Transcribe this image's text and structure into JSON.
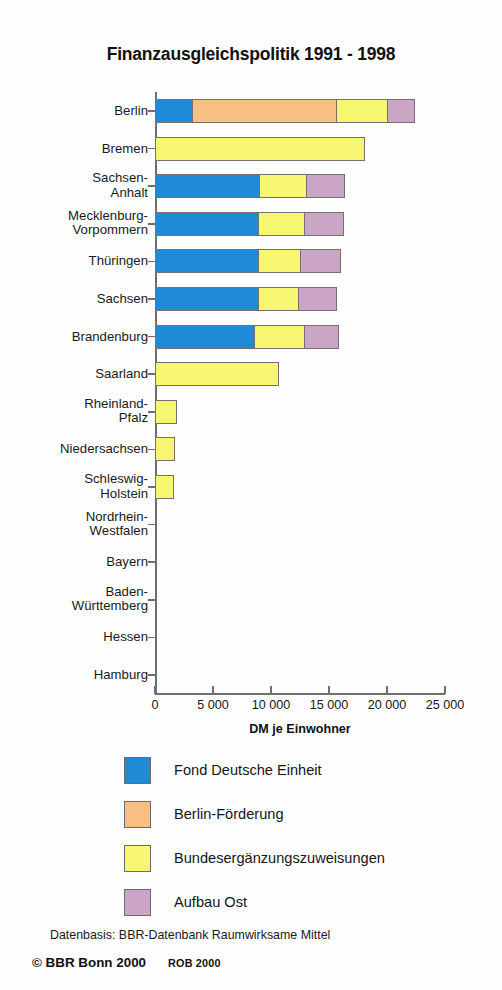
{
  "chart_data": {
    "type": "bar",
    "orientation": "horizontal",
    "stacked": true,
    "title": "Finanzausgleichspolitik 1991 - 1998",
    "xlabel": "DM je Einwohner",
    "ylabel": "",
    "xlim": [
      0,
      25000
    ],
    "xticks": [
      0,
      5000,
      10000,
      15000,
      20000,
      25000
    ],
    "xticklabels": [
      "0",
      "5 000",
      "10 000",
      "15 000",
      "20 000",
      "25 000"
    ],
    "grid": false,
    "legend_position": "below",
    "categories": [
      "Berlin",
      "Bremen",
      "Sachsen-\nAnhalt",
      "Mecklenburg-\nVorpommern",
      "Thüringen",
      "Sachsen",
      "Brandenburg",
      "Saarland",
      "Rheinland-\nPfalz",
      "Niedersachsen",
      "Schleswig-\nHolstein",
      "Nordrhein-\nWestfalen",
      "Bayern",
      "Baden-\nWürttemberg",
      "Hessen",
      "Hamburg"
    ],
    "series": [
      {
        "name": "Fond Deutsche Einheit",
        "color": "#1f8ad6",
        "values": [
          3200,
          0,
          9000,
          8900,
          8900,
          8900,
          8600,
          0,
          0,
          0,
          0,
          0,
          0,
          0,
          0,
          0
        ]
      },
      {
        "name": "Berlin-Förderung",
        "color": "#f8bf84",
        "values": [
          12500,
          0,
          0,
          0,
          0,
          0,
          0,
          0,
          0,
          0,
          0,
          0,
          0,
          0,
          0,
          0
        ]
      },
      {
        "name": "Bundesergänzungszuweisungen",
        "color": "#f6f670",
        "values": [
          4400,
          18100,
          4100,
          4000,
          3700,
          3500,
          4300,
          10700,
          1900,
          1700,
          1600,
          0,
          0,
          0,
          0,
          0
        ]
      },
      {
        "name": "Aufbau Ost",
        "color": "#cba5c6",
        "values": [
          2300,
          0,
          3300,
          3400,
          3400,
          3300,
          3000,
          0,
          0,
          0,
          0,
          0,
          0,
          0,
          0,
          0
        ]
      }
    ],
    "totals": [
      22400,
      18100,
      16400,
      16300,
      16000,
      15700,
      15900,
      10700,
      1900,
      1700,
      1600,
      0,
      0,
      0,
      0,
      0
    ]
  },
  "legend": {
    "items": [
      {
        "label": "Fond Deutsche Einheit",
        "color": "#1f8ad6"
      },
      {
        "label": "Berlin-Förderung",
        "color": "#f8bf84"
      },
      {
        "label": "Bundesergänzungszuweisungen",
        "color": "#f6f670"
      },
      {
        "label": "Aufbau Ost",
        "color": "#cba5c6"
      }
    ]
  },
  "footer": {
    "source": "Datenbasis: BBR-Datenbank Raumwirksame Mittel",
    "copyright": "© BBR Bonn 2000",
    "code": "ROB 2000"
  }
}
